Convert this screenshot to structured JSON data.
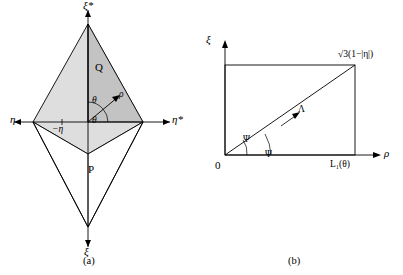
{
  "figure": {
    "panel_a": {
      "caption": "(a)",
      "labels": {
        "xi_star_top": "ξ*",
        "xi_bottom": "ξ",
        "eta_left": "η",
        "eta_star_right": "η*",
        "minus_eta": "−η",
        "point_q": "Q",
        "point_p": "P",
        "rho": "ρ",
        "theta_upper": "θ",
        "theta_lower": "θ"
      },
      "colors": {
        "fill_light": "#d9d9d9",
        "fill_mid": "#bfbfbf",
        "stroke": "#000000"
      }
    },
    "panel_b": {
      "caption": "(b)",
      "labels": {
        "xi_axis": "ξ",
        "rho_axis": "ρ",
        "origin": "0",
        "top_right": "√3(1−|η|)",
        "bottom_right": "L₁(θ)",
        "psi_upper": "Ψ",
        "psi_lower": "Ψ",
        "lambda": "Λ"
      },
      "colors": {
        "stroke": "#000000"
      }
    }
  }
}
